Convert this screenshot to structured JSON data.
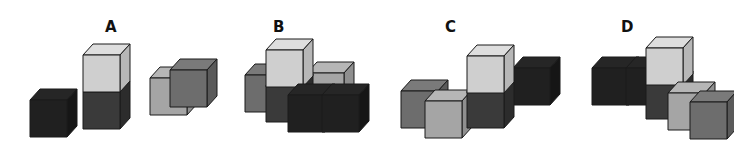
{
  "colors": {
    "black": {
      "front": "#202020",
      "top": "#262626",
      "side": "#161616"
    },
    "dark": {
      "front": "#3a3a3a",
      "top": "#444444",
      "side": "#2c2c2c"
    },
    "mid": {
      "front": "#6d6d6d",
      "top": "#7a7a7a",
      "side": "#5a5a5a"
    },
    "light": {
      "front": "#a5a5a5",
      "top": "#b6b6b6",
      "side": "#8f8f8f"
    },
    "pale": {
      "front": "#cfcfcf",
      "top": "#dedede",
      "side": "#b7b7b7"
    }
  },
  "options": [
    {
      "label": "A",
      "left": 0,
      "label_pos": [
        105,
        18
      ],
      "cubes": [
        {
          "x": 150,
          "y": 78,
          "color": "light"
        },
        {
          "x": 170,
          "y": 70,
          "color": "mid"
        },
        {
          "x": 83,
          "y": 92,
          "color": "dark"
        },
        {
          "x": 83,
          "y": 55,
          "color": "pale"
        },
        {
          "x": 30,
          "y": 100,
          "color": "black"
        }
      ]
    },
    {
      "label": "B",
      "left": 0,
      "label_pos": [
        273,
        18
      ],
      "cubes": [
        {
          "x": 245,
          "y": 75,
          "color": "mid"
        },
        {
          "x": 307,
          "y": 73,
          "color": "light"
        },
        {
          "x": 266,
          "y": 85,
          "color": "dark"
        },
        {
          "x": 266,
          "y": 50,
          "color": "pale"
        },
        {
          "x": 288,
          "y": 95,
          "color": "black"
        },
        {
          "x": 322,
          "y": 95,
          "color": "black"
        }
      ]
    },
    {
      "label": "C",
      "left": 0,
      "label_pos": [
        445,
        18
      ],
      "cubes": [
        {
          "x": 401,
          "y": 91,
          "color": "mid"
        },
        {
          "x": 513,
          "y": 68,
          "color": "black"
        },
        {
          "x": 425,
          "y": 101,
          "color": "light"
        },
        {
          "x": 467,
          "y": 91,
          "color": "dark"
        },
        {
          "x": 467,
          "y": 56,
          "color": "pale"
        }
      ]
    },
    {
      "label": "D",
      "left": 0,
      "label_pos": [
        621,
        18
      ],
      "cubes": [
        {
          "x": 592,
          "y": 68,
          "color": "black"
        },
        {
          "x": 626,
          "y": 68,
          "color": "black"
        },
        {
          "x": 646,
          "y": 82,
          "color": "dark"
        },
        {
          "x": 646,
          "y": 48,
          "color": "pale"
        },
        {
          "x": 668,
          "y": 93,
          "color": "light"
        },
        {
          "x": 690,
          "y": 102,
          "color": "mid"
        }
      ]
    }
  ],
  "cube_size": {
    "w": 37,
    "h": 37,
    "dx": 10,
    "dy": 11
  }
}
